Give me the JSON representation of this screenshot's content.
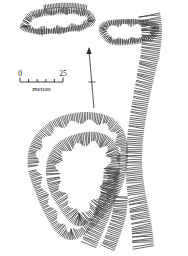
{
  "figure": {
    "type": "earthwork-survey-plan",
    "background_color": "#ffffff",
    "ink_color": "#3a3a3a"
  },
  "scale_bar": {
    "name": "scale-bar",
    "min_label": "0",
    "max_label": "25",
    "unit_label": "metres",
    "divisions": 5,
    "x_start": 20,
    "x_end": 63,
    "y": 82
  },
  "direction_arrow": {
    "name": "direction-arrow",
    "label": "",
    "tip_x": 89,
    "tip_y": 47,
    "tail_x": 94,
    "tail_y": 108,
    "tick_y": 82
  },
  "features": [
    {
      "id": "nw-enclosure",
      "name": "north-west-oval-enclosure",
      "description": "Elongated oval hachured enclosure, upper left",
      "hachure_direction": "inward"
    },
    {
      "id": "ne-enclosure",
      "name": "north-east-rectangular-enclosure",
      "description": "Sub-rectangular hachured enclosure open to the east, upper right",
      "hachure_direction": "inward"
    },
    {
      "id": "east-bank",
      "name": "eastern-linear-bank",
      "description": "Broad linear hachured bank running north-south along the eastern edge",
      "hachure_direction": "west"
    },
    {
      "id": "outer-ring",
      "name": "outer-ringwork-rampart",
      "description": "Outer hachured rampart of the large southern ringwork",
      "hachure_direction": "inward"
    },
    {
      "id": "inner-ring",
      "name": "inner-ringwork-rampart",
      "description": "Inner hachured rampart enclosing the central platform",
      "hachure_direction": "inward"
    },
    {
      "id": "central-platform",
      "name": "central-platform",
      "description": "Blank interior of the ringwork",
      "hachure_direction": "none"
    },
    {
      "id": "south-spur",
      "name": "southern-bank-spur",
      "description": "Hachured bank spur extending south-east from the ringwork",
      "hachure_direction": "west"
    }
  ]
}
